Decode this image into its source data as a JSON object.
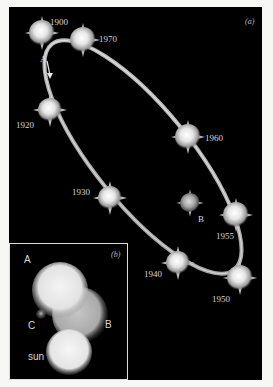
{
  "figure": {
    "panel_a": {
      "label": "(a)",
      "primary_label": "A",
      "companion_label": "B",
      "orbit_points": [
        {
          "year": "1900",
          "x": 33,
          "y": 26
        },
        {
          "year": "1970",
          "x": 74,
          "y": 33
        },
        {
          "year": "1920",
          "x": 41,
          "y": 103
        },
        {
          "year": "1960",
          "x": 179,
          "y": 130
        },
        {
          "year": "1930",
          "x": 101,
          "y": 191
        },
        {
          "year": "1955",
          "x": 227,
          "y": 208
        },
        {
          "year": "1940",
          "x": 169,
          "y": 256
        },
        {
          "year": "1950",
          "x": 231,
          "y": 271
        }
      ],
      "center_star": {
        "label": "B",
        "x": 181,
        "y": 196
      },
      "colors": {
        "background": "#000000",
        "orbit": "#c8c8c8",
        "star": "#f2f2f2"
      }
    },
    "panel_b": {
      "label": "(b)",
      "bodies": [
        {
          "name": "A",
          "label": "A"
        },
        {
          "name": "B",
          "label": "B"
        },
        {
          "name": "C",
          "label": "C"
        },
        {
          "name": "sun",
          "label": "sun"
        }
      ]
    }
  }
}
